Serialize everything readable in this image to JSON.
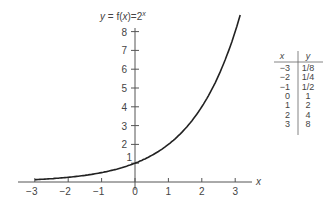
{
  "chart_data": {
    "type": "line",
    "title_parts": {
      "lhs": "y",
      "mid": " = f(",
      "x": "x",
      "rhs": ")=2",
      "exp": "x"
    },
    "xlabel": "x",
    "ylabel": "y",
    "xlim": [
      -3.5,
      3.5
    ],
    "ylim": [
      0,
      8.5
    ],
    "x_ticks": [
      "-3",
      "-2",
      "-1",
      "0",
      "1",
      "2",
      "3"
    ],
    "y_ticks": [
      "1",
      "2",
      "3",
      "4",
      "5",
      "6",
      "7",
      "8"
    ],
    "grid": false,
    "series": [
      {
        "name": "2^x",
        "x": [
          -3,
          -2,
          -1,
          0,
          1,
          2,
          3
        ],
        "y": [
          0.125,
          0.25,
          0.5,
          1,
          2,
          4,
          8
        ]
      }
    ],
    "table": {
      "headers": [
        "x",
        "y"
      ],
      "rows": [
        [
          "-3",
          "1/8"
        ],
        [
          "-2",
          "1/4"
        ],
        [
          "-1",
          "1/2"
        ],
        [
          "0",
          "1"
        ],
        [
          "1",
          "2"
        ],
        [
          "2",
          "4"
        ],
        [
          "3",
          "8"
        ]
      ]
    }
  }
}
